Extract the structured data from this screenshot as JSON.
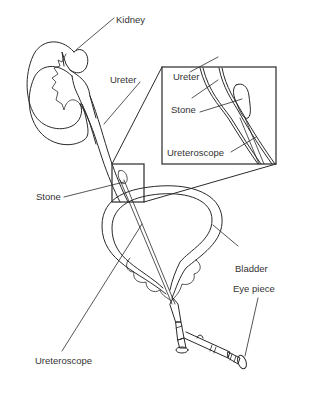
{
  "figure": {
    "type": "anatomical-diagram",
    "labels": {
      "kidney": "Kidney",
      "ureter": "Ureter",
      "stone": "Stone",
      "bladder": "Bladder",
      "ureteroscope": "Ureteroscope",
      "eye_piece": "Eye piece"
    },
    "inset": {
      "labels": {
        "ureter": "Ureter",
        "stone": "Stone",
        "ureteroscope": "Ureteroscope"
      }
    },
    "colors": {
      "line": "#2a2a2a",
      "text": "#333333",
      "background": "#ffffff"
    }
  }
}
